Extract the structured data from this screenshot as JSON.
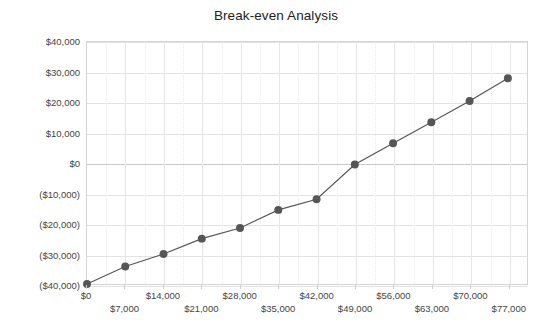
{
  "chart_data": {
    "type": "line",
    "title": "Break-even Analysis",
    "xlabel": "",
    "ylabel": "",
    "grid": true,
    "legend": false,
    "marker": "circle",
    "line_color": "#565656",
    "marker_color": "#565656",
    "xlim": [
      0,
      80500
    ],
    "ylim": [
      -40000,
      40000
    ],
    "x": [
      0,
      7000,
      14000,
      21000,
      28000,
      35000,
      42000,
      49000,
      56000,
      63000,
      70000,
      77000
    ],
    "x_tick_labels": [
      "$0",
      "$7,000",
      "$14,000",
      "$21,000",
      "$28,000",
      "$35,000",
      "$42,000",
      "$49,000",
      "$56,000",
      "$63,000",
      "$70,000",
      "$77,000"
    ],
    "y_ticks": [
      40000,
      30000,
      20000,
      10000,
      0,
      -10000,
      -20000,
      -30000,
      -40000
    ],
    "y_tick_labels": [
      "$40,000",
      "$30,000",
      "$20,000",
      "$10,000",
      "$0",
      "($10,000)",
      "($20,000)",
      "($30,000)",
      "($40,000)"
    ],
    "series": [
      {
        "name": "Profit",
        "values": [
          -40000,
          -34200,
          -30100,
          -25000,
          -21500,
          -15500,
          -12000,
          -500,
          6500,
          13500,
          20500,
          28000
        ]
      }
    ],
    "values": [
      -40000,
      -34200,
      -30100,
      -25000,
      -21500,
      -15500,
      -12000,
      -500,
      6500,
      13500,
      20500,
      28000
    ],
    "last_point": {
      "x": 77000,
      "y": 35000
    },
    "break_even_x": 42000
  }
}
